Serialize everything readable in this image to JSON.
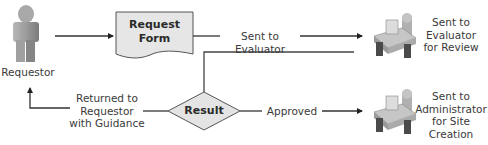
{
  "diagram": {
    "type": "flowchart",
    "nodes": {
      "requestor": {
        "label": "Requestor",
        "icon": "person-icon"
      },
      "request_form": {
        "label_line1": "Request",
        "label_line2": "Form",
        "shape": "document"
      },
      "evaluator": {
        "label_line1": "Sent to",
        "label_line2": "Evaluator",
        "label_line3": "for Review",
        "icon": "desk-worker-icon"
      },
      "result": {
        "label": "Result",
        "shape": "diamond"
      },
      "administrator": {
        "label_line1": "Sent to",
        "label_line2": "Administrator",
        "label_line3": "for Site",
        "label_line4": "Creation",
        "icon": "desk-worker-icon"
      }
    },
    "edges": {
      "sent_to_evaluator": {
        "label": "Sent to Evaluator",
        "from": "request_form",
        "to": "evaluator"
      },
      "approved": {
        "label": "Approved",
        "from": "result",
        "to": "administrator"
      },
      "returned": {
        "label_line1": "Returned to",
        "label_line2": "Requestor",
        "label_line3": "with Guidance",
        "from": "result",
        "to": "requestor"
      }
    },
    "colors": {
      "line": "#3a3a3a",
      "shape_fill": "#e4e4e4",
      "shape_stroke": "#555555",
      "icon_gray": "#9a9a9a",
      "icon_dark": "#4a4a4a"
    }
  }
}
